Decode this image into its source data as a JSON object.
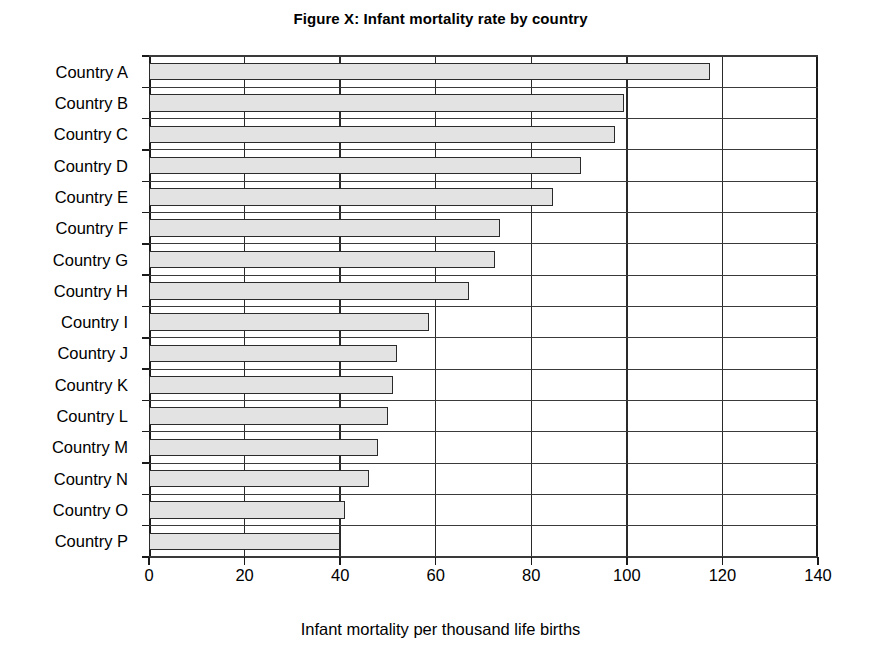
{
  "chart_data": {
    "type": "bar",
    "orientation": "horizontal",
    "title": "Figure X: Infant mortality rate by country",
    "xlabel": "Infant mortality per thousand life births",
    "ylabel": "",
    "xlim": [
      0,
      140
    ],
    "xticks": [
      0,
      20,
      40,
      60,
      80,
      100,
      120,
      140
    ],
    "xtick_labels": [
      "0",
      "20",
      "40",
      "60",
      "80",
      "100",
      "120",
      "140"
    ],
    "grid": true,
    "grid_axis": "x",
    "legend": false,
    "bar_fill_color": "#e3e3e3",
    "bar_edge_color": "#2b2b2b",
    "background_color": "#ffffff",
    "categories": [
      "Country A",
      "Country B",
      "Country C",
      "Country D",
      "Country E",
      "Country F",
      "Country G",
      "Country H",
      "Country I",
      "Country J",
      "Country K",
      "Country L",
      "Country M",
      "Country N",
      "Country O",
      "Country P"
    ],
    "values": [
      117.5,
      99.5,
      97.5,
      90.5,
      84.5,
      73.5,
      72.5,
      67,
      58.5,
      52,
      51,
      50,
      48,
      46,
      41,
      40
    ]
  }
}
